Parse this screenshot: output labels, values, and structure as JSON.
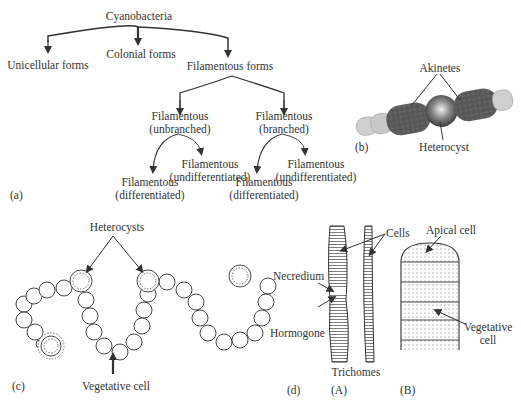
{
  "panel_a": {
    "label": "(a)",
    "root": "Cyanobacteria",
    "level1": [
      "Unicellular forms",
      "Colonial forms",
      "Filamentous forms"
    ],
    "unbranched": {
      "line1": "Filamentous",
      "line2": "(unbranched)"
    },
    "branched": {
      "line1": "Filamentous",
      "line2": "(branched)"
    },
    "leaves": [
      {
        "line1": "Filamentous",
        "line2": "(differentiated)"
      },
      {
        "line1": "Filamentous",
        "line2": "(undifferentiated)"
      },
      {
        "line1": "Filamentous",
        "line2": "(differentiated)"
      },
      {
        "line1": "Filamentous",
        "line2": "(undifferentiated)"
      }
    ]
  },
  "panel_b": {
    "label": "(b)",
    "akinetes": "Akinetes",
    "heterocyst": "Heterocyst",
    "colors": {
      "akinete": "#555555",
      "vegetative": "#c8c8c8",
      "heterocyst": "#6a6a6a"
    }
  },
  "panel_c": {
    "label": "(c)",
    "heterocysts": "Heterocysts",
    "vegetative_cell": "Vegetative cell"
  },
  "panel_d": {
    "label": "(d)",
    "cells": "Cells",
    "necredium": "Necredium",
    "hormogone": "Hormogone",
    "trichomes": "Trichomes",
    "sub_a": "(A)",
    "sub_b": "(B)",
    "apical_cell": "Apical cell",
    "vegetative_line1": "Vegetative",
    "vegetative_line2": "cell"
  }
}
